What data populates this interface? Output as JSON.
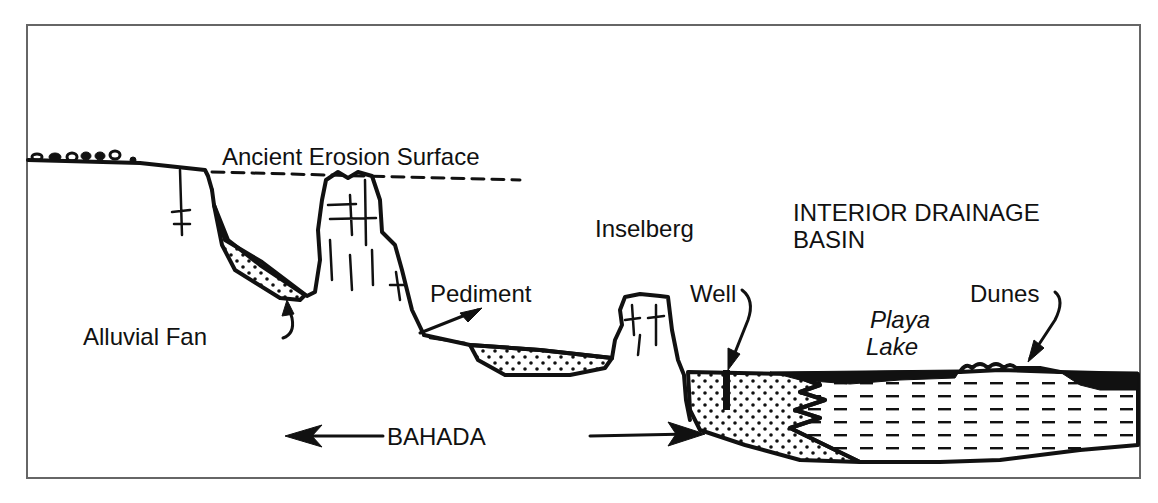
{
  "figure": {
    "colors": {
      "ink": "#111111",
      "frame": "#666666",
      "background": "#ffffff"
    },
    "labels": {
      "ancient_erosion_surface": "Ancient Erosion Surface",
      "inselberg": "Inselberg",
      "interior_drainage_line1": "INTERIOR DRAINAGE",
      "interior_drainage_line2": "BASIN",
      "pediment": "Pediment",
      "well": "Well",
      "dunes": "Dunes",
      "playa_line1": "Playa",
      "playa_line2": "Lake",
      "alluvial_fan": "Alluvial Fan",
      "bahada": "BAHADA"
    },
    "patterns": {
      "alluvium": "dotted (sand/gravel fill)",
      "lake_sediment": "dashed (lacustrine clay)",
      "playa_surface": "solid black (salt crust)"
    }
  }
}
